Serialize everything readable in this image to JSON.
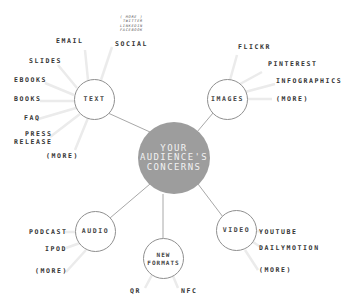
{
  "center": {
    "line1": "YOUR",
    "line2": "AUDIENCE'S",
    "line3": "CONCERNS"
  },
  "nodes": {
    "text": {
      "label": "TEXT"
    },
    "images": {
      "label": "IMAGES"
    },
    "audio": {
      "label": "AUDIO"
    },
    "new_formats": {
      "line1": "NEW",
      "line2": "FORMATS"
    },
    "video": {
      "label": "VIDEO"
    }
  },
  "text_items": {
    "email": "EMAIL",
    "social": "SOCIAL",
    "social_sub": [
      "( MORE )",
      "TWITTER",
      "LINKEDIN",
      "FACEBOOK"
    ],
    "slides": "SLIDES",
    "ebooks": "EBOOKS",
    "books": "BOOKS",
    "faq": "FAQ",
    "press_release": [
      "PRESS",
      "RELEASE"
    ],
    "more": "(MORE)"
  },
  "image_items": [
    "FLICKR",
    "PINTEREST",
    "INFOGRAPHICS",
    "(MORE)"
  ],
  "audio_items": [
    "PODCAST",
    "IPOD",
    "(MORE)"
  ],
  "new_format_items": [
    "QR",
    "NFC"
  ],
  "video_items": [
    "YOUTUBE",
    "DAILYMOTION",
    "(MORE)"
  ],
  "colors": {
    "hub": "#9d9d9d",
    "ring": "#8f8f8f",
    "spoke": "#e6e6e6",
    "link": "#a8a8a8"
  }
}
